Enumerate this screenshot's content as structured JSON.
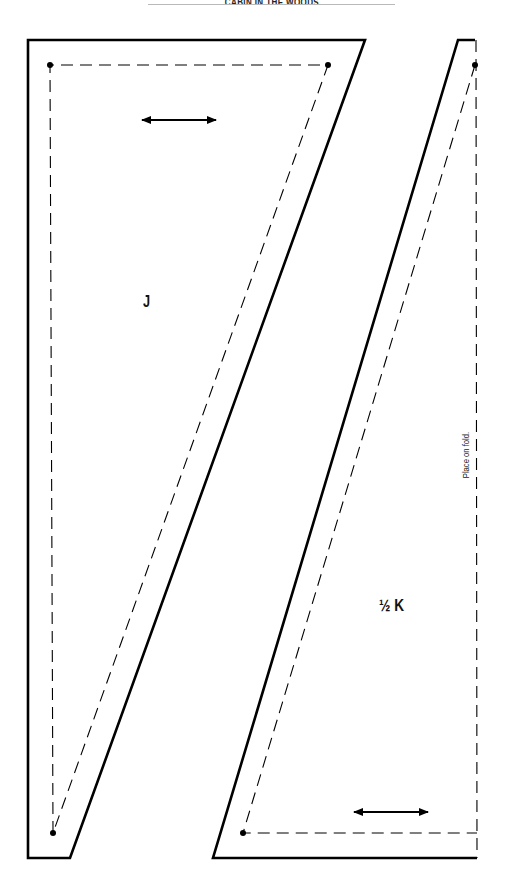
{
  "header": {
    "title": "CABIN IN THE WOODS"
  },
  "pieces": [
    {
      "id": "J",
      "label": "J",
      "grainline": "horizontal double arrow",
      "outer_outline": [
        [
          28,
          40
        ],
        [
          365,
          40
        ],
        [
          70,
          858
        ],
        [
          28,
          858
        ]
      ],
      "seam_line": [
        [
          50,
          65
        ],
        [
          328,
          65
        ],
        [
          53,
          833
        ]
      ],
      "dots": [
        [
          50,
          65
        ],
        [
          328,
          65
        ],
        [
          53,
          833
        ]
      ],
      "grain_arrow": {
        "x1": 140,
        "x2": 218,
        "y": 120
      }
    },
    {
      "id": "K",
      "label": "½ K",
      "label_fraction": "½",
      "label_letter": "K",
      "grainline": "horizontal double arrow",
      "outer_outline": [
        [
          458,
          40
        ],
        [
          475,
          40
        ],
        [
          477,
          858
        ],
        [
          213,
          858
        ]
      ],
      "seam_line": [
        [
          475,
          65
        ],
        [
          243,
          833
        ],
        [
          477,
          833
        ]
      ],
      "fold_line": [
        [
          475,
          40
        ],
        [
          477,
          858
        ]
      ],
      "fold_note": "Place on fold.",
      "dots": [
        [
          475,
          65
        ],
        [
          243,
          833
        ]
      ],
      "grain_arrow": {
        "x1": 352,
        "x2": 430,
        "y": 812
      }
    }
  ],
  "colors": {
    "line": "#000000",
    "header_rule": "#b9b9b9",
    "background": "#ffffff"
  }
}
